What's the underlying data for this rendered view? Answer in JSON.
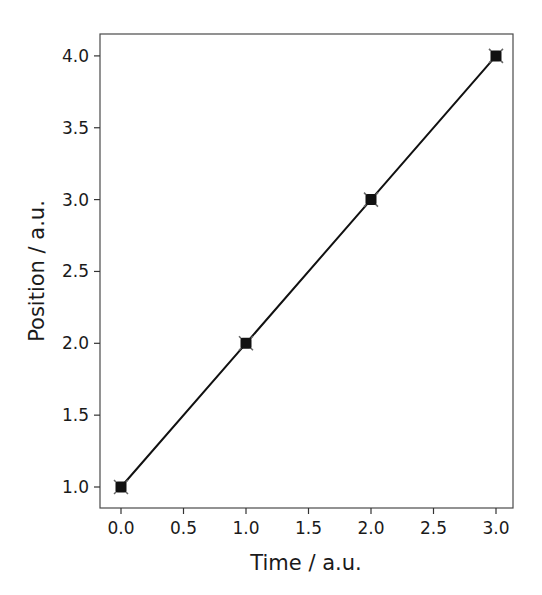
{
  "chart_data": {
    "type": "line",
    "title": "",
    "xlabel": "Time / a.u.",
    "ylabel": "Position / a.u.",
    "x": [
      0.0,
      1.0,
      2.0,
      3.0
    ],
    "series": [
      {
        "name": "position",
        "values": [
          1.0,
          2.0,
          3.0,
          4.0
        ],
        "color": "#000000",
        "marker": "square-with-x"
      }
    ],
    "xlim": [
      -0.1,
      3.1
    ],
    "ylim": [
      0.85,
      4.15
    ],
    "xticks": [
      "0.0",
      "0.5",
      "1.0",
      "1.5",
      "2.0",
      "2.5",
      "3.0"
    ],
    "yticks": [
      "1.0",
      "1.5",
      "2.0",
      "2.5",
      "3.0",
      "3.5",
      "4.0"
    ],
    "grid": false,
    "legend": null
  },
  "labels": {
    "xlabel": "Time / a.u.",
    "ylabel": "Position / a.u."
  }
}
